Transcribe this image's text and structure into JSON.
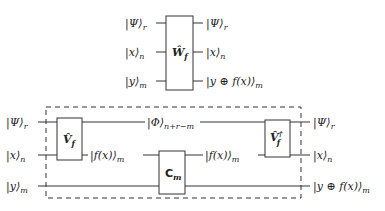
{
  "top_circuit": {
    "gate": {
      "symbol": "Ŵ",
      "subscript": "f"
    },
    "inputs": [
      {
        "ket": "|Ψ⟩",
        "subscript": "r"
      },
      {
        "ket": "|x⟩",
        "subscript": "n"
      },
      {
        "ket": "|y⟩",
        "subscript": "m"
      }
    ],
    "outputs": [
      {
        "ket": "|Ψ⟩",
        "subscript": "r"
      },
      {
        "ket": "|x⟩",
        "subscript": "n"
      },
      {
        "ket": "|y ⊕ f(x)⟩",
        "subscript": "m"
      }
    ]
  },
  "bottom_circuit": {
    "gate_v": {
      "symbol": "V̂",
      "subscript": "f"
    },
    "gate_c": {
      "symbol": "C",
      "subscript": "m"
    },
    "gate_vdag": {
      "symbol": "V̂",
      "superscript": "†",
      "subscript": "f"
    },
    "inputs": [
      {
        "ket": "|Ψ⟩",
        "subscript": "r"
      },
      {
        "ket": "|x⟩",
        "subscript": "n"
      },
      {
        "ket": "|y⟩",
        "subscript": "m"
      }
    ],
    "mid_labels": {
      "phi": {
        "ket": "|Φ⟩",
        "subscript": "n+r−m"
      },
      "fx_left": {
        "ket": "|f(x)⟩",
        "subscript": "m"
      },
      "fx_right": {
        "ket": "|f(x)⟩",
        "subscript": "m"
      }
    },
    "outputs": [
      {
        "ket": "|Ψ⟩",
        "subscript": "r"
      },
      {
        "ket": "|x⟩",
        "subscript": "n"
      },
      {
        "ket": "|y ⊕ f(x)⟩",
        "subscript": "m"
      }
    ]
  }
}
